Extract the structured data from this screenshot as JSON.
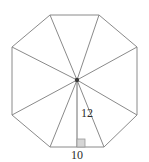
{
  "figure": {
    "shape_name": "regular-octagon",
    "stroke_color": "#8a8a8a",
    "background_color": "#ffffff",
    "center_marker_color": "#3a3a3a",
    "right_angle_marker_color": "#d6d6d6",
    "label_color": "#2b2b2b"
  },
  "labels": {
    "apothem": "12",
    "side": "10"
  },
  "geometry": {
    "center": {
      "x": 77,
      "y": 80
    },
    "vertices": [
      {
        "name": "top-left",
        "x": 50,
        "y": 15
      },
      {
        "name": "top-right",
        "x": 99,
        "y": 15
      },
      {
        "name": "right-top",
        "x": 137,
        "y": 47
      },
      {
        "name": "right-bottom",
        "x": 137,
        "y": 115
      },
      {
        "name": "bottom-right",
        "x": 104,
        "y": 147
      },
      {
        "name": "bottom-left",
        "x": 50,
        "y": 147
      },
      {
        "name": "left-bottom",
        "x": 12,
        "y": 115
      },
      {
        "name": "left-top",
        "x": 12,
        "y": 47
      }
    ],
    "apothem_foot": {
      "x": 77,
      "y": 147
    },
    "right_angle_box": {
      "x": 77,
      "y": 139,
      "size": 8
    }
  }
}
